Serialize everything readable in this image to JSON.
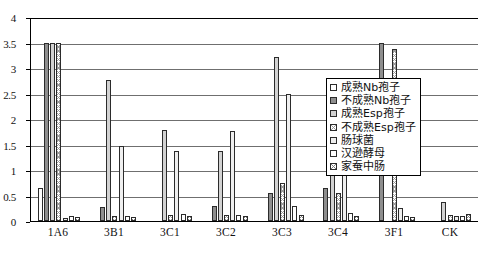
{
  "chart_data": {
    "type": "bar",
    "title": "",
    "xlabel": "",
    "ylabel": "",
    "ylim": [
      0,
      4
    ],
    "ytick_step": 0.5,
    "yticks": [
      "0",
      "0.5",
      "1",
      "1.5",
      "2",
      "2.5",
      "3",
      "3.5",
      "4"
    ],
    "grid": true,
    "legend_position": "center-right",
    "categories": [
      "1A6",
      "3B1",
      "3C1",
      "3C2",
      "3C3",
      "3C4",
      "3F1",
      "CK"
    ],
    "series": [
      {
        "name": "成熟Nb孢子",
        "pattern": "white-open",
        "values": [
          0.65,
          0.0,
          0.0,
          0.0,
          0.0,
          0.0,
          0.0,
          0.0
        ]
      },
      {
        "name": "不成熟Nb孢子",
        "pattern": "dark-gray-solid",
        "values": [
          3.5,
          0.28,
          0.0,
          0.3,
          0.55,
          0.65,
          3.5,
          0.0
        ]
      },
      {
        "name": "成熟Esp孢子",
        "pattern": "light-gray",
        "values": [
          3.5,
          2.76,
          1.78,
          1.38,
          3.22,
          2.42,
          0.0,
          0.38
        ]
      },
      {
        "name": "不成熟Esp孢子",
        "pattern": "cross-hatch-fine",
        "values": [
          3.5,
          0.1,
          0.12,
          0.12,
          0.75,
          0.55,
          3.38,
          0.12
        ]
      },
      {
        "name": "肠球菌",
        "pattern": "pale-gray",
        "values": [
          0.06,
          1.48,
          1.38,
          1.76,
          2.5,
          1.76,
          0.26,
          0.1
        ]
      },
      {
        "name": "汉逊酵母",
        "pattern": "white-open",
        "values": [
          0.1,
          0.1,
          0.14,
          0.12,
          0.3,
          0.15,
          0.1,
          0.1
        ]
      },
      {
        "name": "家蚕中肠",
        "pattern": "cross-hatch",
        "values": [
          0.07,
          0.08,
          0.1,
          0.1,
          0.12,
          0.1,
          0.08,
          0.14
        ]
      }
    ]
  },
  "legend": {
    "items": [
      {
        "label": "成熟Nb孢子"
      },
      {
        "label": "不成熟Nb孢子"
      },
      {
        "label": "成熟Esp孢子"
      },
      {
        "label": "不成熟Esp孢子"
      },
      {
        "label": "肠球菌"
      },
      {
        "label": "汉逊酵母"
      },
      {
        "label": "家蚕中肠"
      }
    ]
  }
}
